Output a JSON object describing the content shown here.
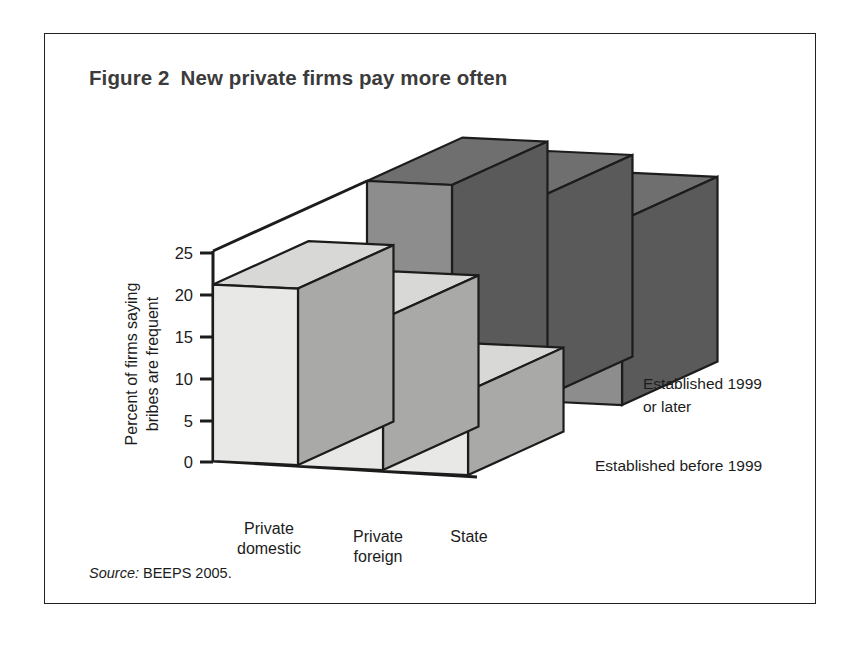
{
  "figure": {
    "number": "Figure 2",
    "title": "New private firms pay more often"
  },
  "source": {
    "label": "Source:",
    "text": "BEEPS 2005."
  },
  "chart_data": {
    "type": "bar",
    "variant": "3d-grouped-bar",
    "title": "New private firms pay more often",
    "xlabel": "",
    "ylabel": "Percent of firms saying bribes are frequent",
    "ylim": [
      0,
      25
    ],
    "yticks": [
      "0",
      "5",
      "10",
      "15",
      "20",
      "25"
    ],
    "ytick_values": [
      0,
      5,
      10,
      15,
      20,
      25
    ],
    "grid": false,
    "legend_position": "right-inline",
    "categories": [
      "Private domestic",
      "Private foreign",
      "State"
    ],
    "category_labels": [
      {
        "line1": "Private",
        "line2": "domestic"
      },
      {
        "line1": "Private",
        "line2": "foreign"
      },
      {
        "line1": "State",
        "line2": ""
      }
    ],
    "series": [
      {
        "name": "Established 1999 or later",
        "label_line1": "Established 1999",
        "label_line2": "or later",
        "row": "back",
        "color": "#8a8a8a",
        "top_color": "#707070",
        "side_color": "#585858",
        "values": [
          25,
          24,
          22
        ]
      },
      {
        "name": "Established before 1999",
        "label_line1": "Established before 1999",
        "label_line2": "",
        "row": "front",
        "color": "#e6e6e4",
        "top_color": "#d2d2d0",
        "side_color": "#a8a8a6",
        "values": [
          21,
          18,
          10
        ]
      }
    ],
    "colors": {
      "axis": "#1c1c1c",
      "outline": "#1c1c1c",
      "front_face": "#e8e8e6",
      "front_top": "#d8d8d6",
      "back_face": "#8d8d8d",
      "back_top": "#6f6f6f",
      "back_side": "#5a5a5a",
      "background": "#ffffff",
      "border": "#221f1f"
    }
  }
}
